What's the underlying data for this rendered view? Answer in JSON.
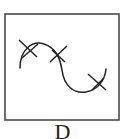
{
  "figure": {
    "label": "D",
    "frame": {
      "x": 5,
      "y": 14,
      "width": 114,
      "height": 106,
      "stroke": "#4a4a4a"
    },
    "curve": {
      "path": "M20 68 C 20 50, 32 40, 44 44 C 56 48, 60 58, 62 70 C 64 86, 74 94, 86 92 C 98 90, 105 80, 106 69",
      "stroke": "#222222"
    },
    "crosses": [
      {
        "line1": [
          19,
          40,
          37,
          57
        ],
        "line2": [
          22,
          58,
          38,
          44
        ]
      },
      {
        "line1": [
          50,
          62,
          67,
          46
        ],
        "line2": [
          52,
          50,
          65,
          62
        ]
      },
      {
        "line1": [
          88,
          74,
          106,
          90
        ],
        "line2": [
          92,
          90,
          104,
          78
        ]
      }
    ]
  }
}
